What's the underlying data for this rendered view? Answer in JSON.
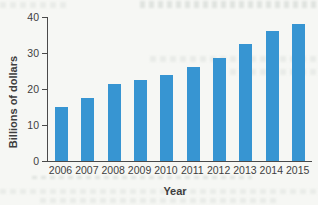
{
  "figure": {
    "kind": "scanned textbook bar chart"
  },
  "chart_data": {
    "type": "bar",
    "categories": [
      "2006",
      "2007",
      "2008",
      "2009",
      "2010",
      "2011",
      "2012",
      "2013",
      "2014",
      "2015"
    ],
    "values": [
      15,
      17.5,
      21.5,
      22.5,
      24,
      26,
      28.5,
      32.5,
      36,
      38
    ],
    "title": "",
    "xlabel": "Year",
    "ylabel": "Billions of dollars",
    "ylim": [
      0,
      40
    ],
    "yticks": [
      0,
      10,
      20,
      30,
      40
    ],
    "grid": false,
    "legend": null,
    "bar_color": "#3795d2",
    "axis_color": "#4a4a4a",
    "text_color": "#3e3e3e",
    "background_color": "#f6f7f4"
  }
}
